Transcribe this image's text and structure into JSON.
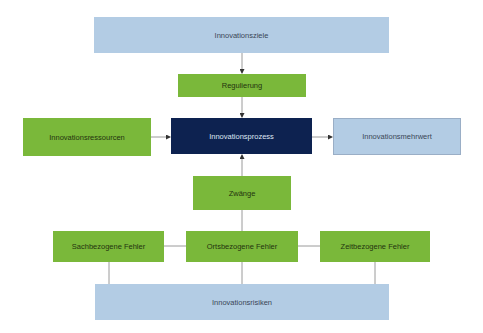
{
  "diagram": {
    "nodes": {
      "ziele": "Innovationsziele",
      "regulierung": "Regulierung",
      "ressourcen": "Innovationsressourcen",
      "prozess": "Innovationsprozess",
      "mehrwert": "Innovationsmehrwert",
      "zwaenge": "Zwänge",
      "sach": "Sachbezogene Fehler",
      "orts": "Ortsbezogene Fehler",
      "zeit": "Zeitbezogene Fehler",
      "risiken": "Innovationsrisiken"
    },
    "edges": [
      {
        "from": "Innovationsziele",
        "to": "Regulierung",
        "arrow": true
      },
      {
        "from": "Regulierung",
        "to": "Innovationsprozess",
        "arrow": true
      },
      {
        "from": "Innovationsressourcen",
        "to": "Innovationsprozess",
        "arrow": true
      },
      {
        "from": "Innovationsprozess",
        "to": "Innovationsmehrwert",
        "arrow": true
      },
      {
        "from": "Zwänge",
        "to": "Innovationsprozess",
        "arrow": true
      },
      {
        "from": "Ortsbezogene Fehler",
        "to": "Zwänge",
        "arrow": false
      },
      {
        "from": "Sachbezogene Fehler",
        "to": "Ortsbezogene Fehler",
        "arrow": false
      },
      {
        "from": "Zeitbezogene Fehler",
        "to": "Ortsbezogene Fehler",
        "arrow": false
      },
      {
        "from": "Sachbezogene Fehler",
        "to": "Innovationsrisiken",
        "arrow": false
      },
      {
        "from": "Ortsbezogene Fehler",
        "to": "Innovationsrisiken",
        "arrow": false
      },
      {
        "from": "Zeitbezogene Fehler",
        "to": "Innovationsrisiken",
        "arrow": false
      }
    ],
    "colors": {
      "light_blue": "#b3cce4",
      "green": "#7ab83a",
      "navy": "#0d2250",
      "connector": "#999999"
    }
  }
}
